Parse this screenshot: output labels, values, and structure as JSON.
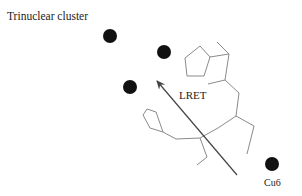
{
  "title": "Trinuclear cluster",
  "arrow_label": "LRET",
  "acceptor_label": "Cu6",
  "colors": {
    "ball": "#111111",
    "arrow": "#444444",
    "molecule": "#8a8a8a",
    "text": "#222222",
    "background": "#ffffff"
  },
  "trinuclear_atoms": [
    {
      "name": "cu-atom-1",
      "cx": 110,
      "cy": 36,
      "r": 7
    },
    {
      "name": "cu-atom-2",
      "cx": 164,
      "cy": 52,
      "r": 7
    },
    {
      "name": "cu-atom-3",
      "cx": 130,
      "cy": 87,
      "r": 7
    }
  ],
  "cu6_atom": {
    "cx": 272,
    "cy": 164,
    "r": 7
  },
  "arrow": {
    "x1": 237,
    "y1": 175,
    "x2": 157,
    "y2": 81
  }
}
